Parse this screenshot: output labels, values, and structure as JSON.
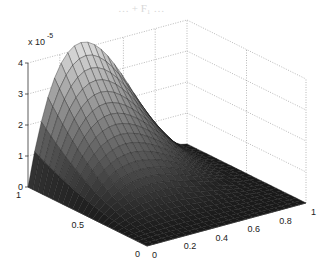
{
  "figure": {
    "title_faint": "… + F₁ …",
    "background": "#ffffff"
  },
  "chart_data": {
    "type": "surface3d",
    "title": "",
    "xlabel": "",
    "ylabel": "",
    "zlabel": "",
    "xlim": [
      0,
      1
    ],
    "ylim": [
      0,
      1
    ],
    "zlim": [
      0,
      4e-05
    ],
    "z_exponent_label": "x 10",
    "z_exponent": "-5",
    "x_ticks": [
      "0",
      "0.2",
      "0.4",
      "0.6",
      "0.8",
      "1"
    ],
    "y_ticks": [
      "0",
      "0.5",
      "1"
    ],
    "z_ticks": [
      "0",
      "1",
      "2",
      "3",
      "4"
    ],
    "grid": true,
    "colormap": "gray",
    "surface_description": "Smooth hump, zero along x=0, x=1 and y=0; peak ≈ 4.2e-5 near x≈0.33, y=1",
    "peak": {
      "x": 0.33,
      "y": 1.0,
      "z": 4.2e-05
    },
    "mesh_resolution": 24
  }
}
